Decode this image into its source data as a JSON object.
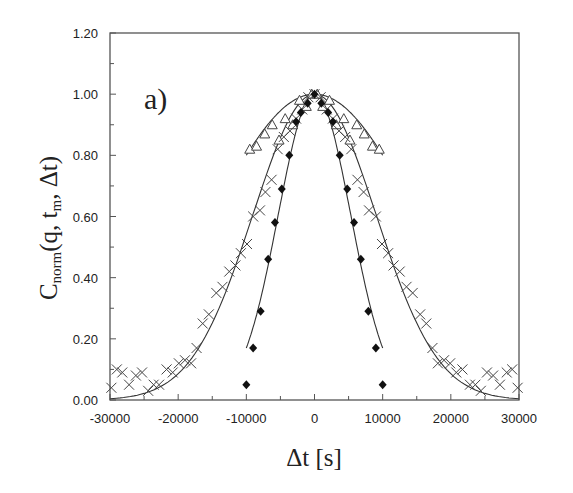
{
  "chart_data": {
    "type": "scatter",
    "title": "",
    "panel_label": "a)",
    "xlabel": "Δt [s]",
    "ylabel": "C_norm(q, t_m, Δt)",
    "ylabel_parts": {
      "main": "C",
      "sub": "norm",
      "args": "(q, t",
      "args_sub": "m",
      "args_end": ", Δt)"
    },
    "xlim": [
      -30000,
      30000
    ],
    "ylim": [
      0,
      1.2
    ],
    "xticks": [
      -30000,
      -20000,
      -10000,
      0,
      10000,
      20000,
      30000
    ],
    "xtick_labels": [
      "-30000",
      "-20000",
      "-10000",
      "0",
      "10000",
      "20000",
      "30000"
    ],
    "yticks": [
      0,
      0.2,
      0.4,
      0.6,
      0.8,
      1.0,
      1.2
    ],
    "ytick_labels": [
      "0.00",
      "0.20",
      "0.40",
      "0.60",
      "0.80",
      "1.00",
      "1.20"
    ],
    "grid": false,
    "legend": null,
    "series": [
      {
        "name": "triangles",
        "marker": "open-triangle",
        "x": [
          -9500,
          -8500,
          -7300,
          -6200,
          -5200,
          -4300,
          -3200,
          -2200,
          -1200,
          -400,
          400,
          1200,
          2200,
          3200,
          4300,
          5200,
          6200,
          7300,
          8500,
          9500
        ],
        "y": [
          0.82,
          0.83,
          0.87,
          0.9,
          0.85,
          0.92,
          0.9,
          0.98,
          0.96,
          1.0,
          1.0,
          0.96,
          0.98,
          0.9,
          0.92,
          0.85,
          0.9,
          0.87,
          0.83,
          0.82
        ]
      },
      {
        "name": "crosses",
        "marker": "x",
        "x": [
          -29800,
          -29000,
          -28200,
          -27200,
          -26200,
          -25300,
          -24400,
          -23600,
          -22800,
          -21700,
          -20800,
          -19900,
          -19000,
          -18100,
          -17300,
          -16400,
          -15500,
          -14400,
          -13500,
          -12500,
          -11600,
          -10800,
          -9900,
          -9000,
          -8000,
          -7200,
          -6300,
          -5400,
          -4500,
          -3600,
          -2700,
          -1800,
          -900,
          0,
          900,
          1800,
          2700,
          3600,
          4500,
          5400,
          6300,
          7200,
          8000,
          9000,
          9900,
          10800,
          11600,
          12500,
          13500,
          14400,
          15500,
          16400,
          17300,
          18100,
          19000,
          19900,
          20800,
          21700,
          22800,
          23600,
          24400,
          25300,
          26200,
          27200,
          28200,
          29000,
          29800
        ],
        "y": [
          0.04,
          0.1,
          0.09,
          0.05,
          0.08,
          0.09,
          0.03,
          0.05,
          0.05,
          0.1,
          0.09,
          0.12,
          0.13,
          0.12,
          0.17,
          0.25,
          0.28,
          0.35,
          0.37,
          0.42,
          0.44,
          0.48,
          0.51,
          0.6,
          0.62,
          0.68,
          0.72,
          0.82,
          0.86,
          0.88,
          0.92,
          0.95,
          0.99,
          1.0,
          0.99,
          0.95,
          0.92,
          0.88,
          0.86,
          0.82,
          0.72,
          0.68,
          0.62,
          0.6,
          0.51,
          0.48,
          0.44,
          0.42,
          0.37,
          0.35,
          0.28,
          0.25,
          0.17,
          0.12,
          0.13,
          0.12,
          0.09,
          0.1,
          0.05,
          0.05,
          0.03,
          0.09,
          0.08,
          0.05,
          0.09,
          0.1,
          0.04
        ]
      },
      {
        "name": "diamonds",
        "marker": "filled-diamond",
        "x": [
          -10000,
          -9000,
          -7900,
          -6800,
          -5800,
          -4800,
          -3700,
          -2700,
          -2000,
          -1000,
          0,
          1000,
          2000,
          2700,
          3700,
          4800,
          5800,
          6800,
          7900,
          9000,
          10000
        ],
        "y": [
          0.05,
          0.17,
          0.29,
          0.46,
          0.58,
          0.69,
          0.8,
          0.91,
          0.94,
          0.97,
          1.0,
          0.97,
          0.94,
          0.91,
          0.8,
          0.69,
          0.58,
          0.46,
          0.29,
          0.17,
          0.05
        ]
      }
    ],
    "fit_curves": [
      {
        "name": "fit-triangles",
        "x_range": [
          -10000,
          10000
        ],
        "y_at_0": 1.0,
        "y_at_edge": 0.8
      },
      {
        "name": "fit-crosses",
        "x_range": [
          -30000,
          30000
        ],
        "y_at_0": 1.0,
        "y_at_edge": 0.0
      },
      {
        "name": "fit-diamonds",
        "x_range": [
          -10000,
          10000
        ],
        "y_at_0": 1.0,
        "y_at_edge": 0.17
      }
    ]
  }
}
